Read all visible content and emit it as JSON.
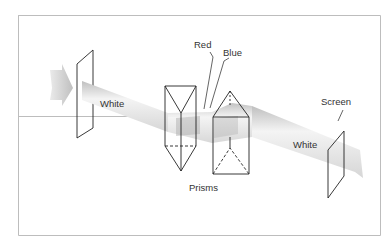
{
  "diagram": {
    "labels": {
      "white_in": "White",
      "red": "Red",
      "blue": "Blue",
      "screen": "Screen",
      "white_out": "White",
      "prisms": "Prisms"
    },
    "colors": {
      "border": "#bdbdbd",
      "line": "#222222",
      "beam": "#d9d9d9",
      "arrow": "#c8c8c8",
      "text": "#333333"
    }
  }
}
